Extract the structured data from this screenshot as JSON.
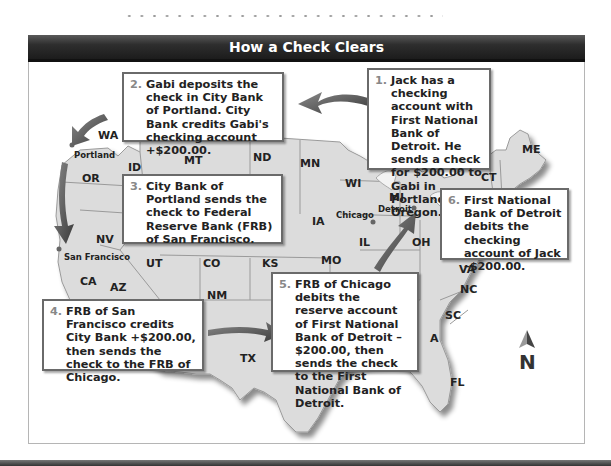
{
  "title": "How a Check Clears",
  "steps": [
    {
      "num": "1.",
      "text": "Jack has a checking account with First National Bank of Detroit. He sends a check for $200.00 to Gabi in Portland, Oregon."
    },
    {
      "num": "2.",
      "text": "Gabi deposits the check in City Bank of Portland. City Bank credits Gabi's checking account +$200.00."
    },
    {
      "num": "3.",
      "text": "City Bank of Portland sends the check to Federal Reserve Bank (FRB) of San Francisco."
    },
    {
      "num": "4.",
      "text": "FRB of San Francisco credits City Bank +$200.00, then sends the check to the FRB of Chicago."
    },
    {
      "num": "5.",
      "text": "FRB of Chicago debits the reserve account of First National Bank of Detroit –$200.00, then sends the check to the First National Bank of Detroit."
    },
    {
      "num": "6.",
      "text": "First National Bank of Detroit debits the checking account of Jack –$200.00."
    }
  ],
  "states": {
    "WA": "WA",
    "OR": "OR",
    "ID": "ID",
    "MT": "MT",
    "ND": "ND",
    "MN": "MN",
    "WI": "WI",
    "MI": "MI",
    "NV": "NV",
    "CA": "CA",
    "UT": "UT",
    "CO": "CO",
    "KS": "KS",
    "IA": "IA",
    "IL": "IL",
    "MO": "MO",
    "OH": "OH",
    "AZ": "AZ",
    "NM": "NM",
    "TX": "TX",
    "VA": "VA",
    "NC": "NC",
    "SC": "SC",
    "GA": "A",
    "FL": "FL",
    "ME": "ME",
    "CT": "CT"
  },
  "cities": {
    "portland": "Portland",
    "san_francisco": "San Francisco",
    "chicago": "Chicago",
    "detroit": "Detroit"
  },
  "compass": {
    "label": "N"
  }
}
